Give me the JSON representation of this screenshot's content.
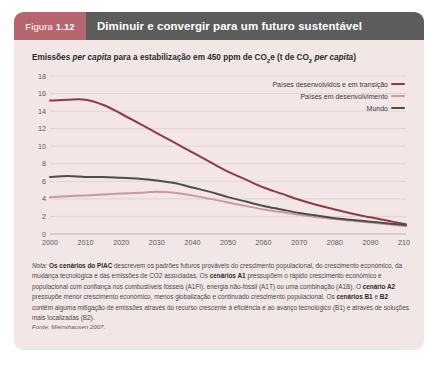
{
  "figure": {
    "number_word": "Figura",
    "number": "1.12",
    "title": "Diminuir e convergir para um futuro sustentável",
    "subtitle_parts": {
      "p1": "Emissões ",
      "p2": "per capita",
      "p3": " para a estabilização em 450 ppm de CO",
      "sub1": "2",
      "p4": "e (t de CO",
      "sub2": "2",
      "p5": " ",
      "p6": "per capita",
      "p7": ")"
    },
    "subtitle_plain": "Emissões per capita para a estabilização em 450 ppm de CO2e (t de CO2 per capita)"
  },
  "notes": {
    "label": "Nota:",
    "bold1": "Os cenários do PIAC",
    "text1": " descrevem os padrões futuros prováveis do crescimento populacional, do crescimento económico, da mudança tecnológica e das emissões de CO2 associadas. Os ",
    "bold2": "cenários A1",
    "text2": " pressupõem o rápido crescimento económico e populacional com confiança nos combustíveis fósseis (A1FI), energia não-fóssil (A1T) ou uma combinação (A1B). O ",
    "bold3": "cenário A2",
    "text3": " pressupõe menor crescimento económico, menos globalização e continuado crescimento populacional. Os ",
    "bold4": "cenários B1",
    "text4": " e ",
    "bold5": "B2",
    "text5": " contêm alguma mitigação de emissões através do recurso crescente à eficiência e ao avanço tecnológico (B1) e através de soluções mais localizadas (B2)."
  },
  "source": {
    "label": "Fonte:",
    "text": " Meinshausen 2007."
  },
  "colors": {
    "panel_background": "#f2e6e6",
    "figure_number_box": "#b5666f",
    "title_bar": "#5c5c5c",
    "developed": "#8e3b44",
    "developing": "#c99aa0",
    "world": "#4d4d4d",
    "gridline": "#ddcaca"
  },
  "chart_data": {
    "type": "line",
    "title": "Emissões per capita para a estabilização em 450 ppm de CO2e (t de CO2 per capita)",
    "xlabel": "",
    "ylabel": "",
    "xlim": [
      2000,
      2100
    ],
    "ylim": [
      0,
      18
    ],
    "grid": true,
    "legend_position": "top-right",
    "xticks": [
      2000,
      2010,
      2020,
      2030,
      2040,
      2050,
      2060,
      2070,
      2080,
      2090,
      2100
    ],
    "yticks": [
      0,
      2,
      4,
      6,
      8,
      10,
      12,
      14,
      16,
      18
    ],
    "x": [
      2000,
      2005,
      2010,
      2015,
      2020,
      2025,
      2030,
      2035,
      2040,
      2045,
      2050,
      2055,
      2060,
      2065,
      2070,
      2075,
      2080,
      2085,
      2090,
      2095,
      2100
    ],
    "series": [
      {
        "name": "Países desenvolvidos e em transição",
        "color": "#8e3b44",
        "values": [
          15.2,
          15.3,
          15.3,
          14.7,
          13.7,
          12.6,
          11.5,
          10.4,
          9.3,
          8.2,
          7.1,
          6.2,
          5.3,
          4.6,
          3.9,
          3.3,
          2.8,
          2.3,
          1.9,
          1.5,
          1.1
        ]
      },
      {
        "name": "Países em desenvolvimento",
        "color": "#c99aa0",
        "values": [
          4.2,
          4.3,
          4.4,
          4.5,
          4.6,
          4.7,
          4.8,
          4.7,
          4.4,
          4.0,
          3.6,
          3.2,
          2.8,
          2.5,
          2.2,
          1.9,
          1.7,
          1.5,
          1.3,
          1.1,
          0.9
        ]
      },
      {
        "name": "Mundo",
        "color": "#4d4d4d",
        "values": [
          6.5,
          6.6,
          6.5,
          6.5,
          6.4,
          6.3,
          6.1,
          5.8,
          5.3,
          4.8,
          4.2,
          3.7,
          3.2,
          2.8,
          2.4,
          2.1,
          1.8,
          1.6,
          1.4,
          1.2,
          1.0
        ]
      }
    ]
  },
  "legend": [
    {
      "label": "Países desenvolvidos e em transição",
      "color": "#8e3b44"
    },
    {
      "label": "Países em desenvolvimento",
      "color": "#c99aa0"
    },
    {
      "label": "Mundo",
      "color": "#4d4d4d"
    }
  ]
}
